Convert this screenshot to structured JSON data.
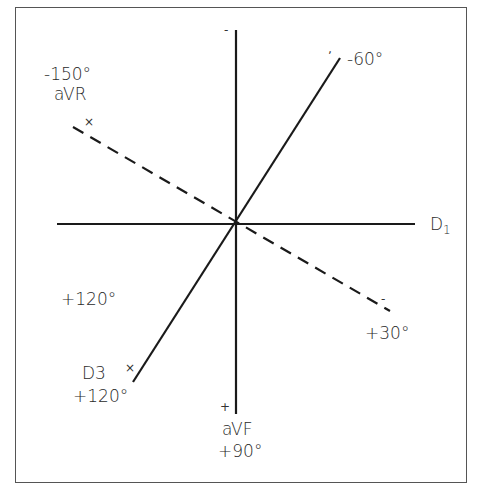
{
  "diagram": {
    "type": "hexaxial-lead-reference",
    "labels": {
      "avr_angle": "-150°",
      "avr_name": "aVR",
      "d1_main": "D",
      "d1_sub": "1",
      "minus60": "-60°",
      "plus30": "+30°",
      "plus120_mid": "+120°",
      "d3_name": "D3",
      "d3_angle": "+120°",
      "avf_name": "aVF",
      "avf_angle": "+90°"
    },
    "marks": {
      "top_minus": "-",
      "avf_plus": "+",
      "avr_cross": "×",
      "d3_cross": "×",
      "minus60_tick": "ʼ",
      "plus30_tick": "-"
    },
    "axes": [
      {
        "name": "D1",
        "angle": 0,
        "style": "solid"
      },
      {
        "name": "aVF",
        "angle": 90,
        "style": "solid"
      },
      {
        "name": "D3 / -60",
        "angle": 120,
        "style": "solid"
      },
      {
        "name": "aVR / +30",
        "angle": -150,
        "style": "dashed"
      }
    ],
    "colors": {
      "line": "#1a1a1a",
      "border": "#555555",
      "text": "#2a2a2a"
    }
  }
}
